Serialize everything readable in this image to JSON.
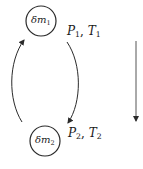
{
  "diagram": {
    "type": "process-cycle",
    "nodes": [
      {
        "id": "m1",
        "symbol": "δm",
        "subscript": "1",
        "state": {
          "P": "P",
          "P_sub": "1",
          "sep": ", ",
          "T": "T",
          "T_sub": "1"
        }
      },
      {
        "id": "m2",
        "symbol": "δm",
        "subscript": "2",
        "state": {
          "P": "P",
          "P_sub": "2",
          "sep": ", ",
          "T": "T",
          "T_sub": "2"
        }
      }
    ],
    "edges": [
      {
        "from": "m1",
        "to": "m2",
        "side": "right",
        "direction": "down"
      },
      {
        "from": "m2",
        "to": "m1",
        "side": "left",
        "direction": "up"
      }
    ],
    "side_arrow": {
      "direction": "down"
    },
    "colors": {
      "stroke": "#2a2a2a",
      "text": "#1a1a1a",
      "background": "#ffffff"
    }
  }
}
